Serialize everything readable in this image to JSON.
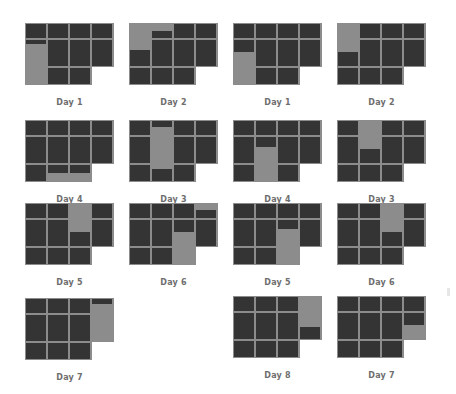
{
  "colors": {
    "cell": "#343434",
    "highlight": "#8c8c8c",
    "label": "#6e6e6e",
    "background": "#ffffff"
  },
  "panels": [
    {
      "label": "Day 1",
      "x": 25,
      "y": 23
    },
    {
      "label": "Day 2",
      "x": 129,
      "y": 23
    },
    {
      "label": "Day 1",
      "x": 233,
      "y": 23
    },
    {
      "label": "Day 2",
      "x": 337,
      "y": 23
    },
    {
      "label": "Day 4",
      "x": 25,
      "y": 120
    },
    {
      "label": "Day 3",
      "x": 129,
      "y": 120
    },
    {
      "label": "Day 4",
      "x": 233,
      "y": 120
    },
    {
      "label": "Day 3",
      "x": 337,
      "y": 120
    },
    {
      "label": "Day 5",
      "x": 25,
      "y": 203
    },
    {
      "label": "Day 6",
      "x": 129,
      "y": 203
    },
    {
      "label": "Day 5",
      "x": 233,
      "y": 203
    },
    {
      "label": "Day 6",
      "x": 337,
      "y": 203
    },
    {
      "label": "Day 7",
      "x": 25,
      "y": 298
    },
    {
      "label": "Day 8",
      "x": 233,
      "y": 296
    },
    {
      "label": "Day 7",
      "x": 337,
      "y": 296
    }
  ]
}
